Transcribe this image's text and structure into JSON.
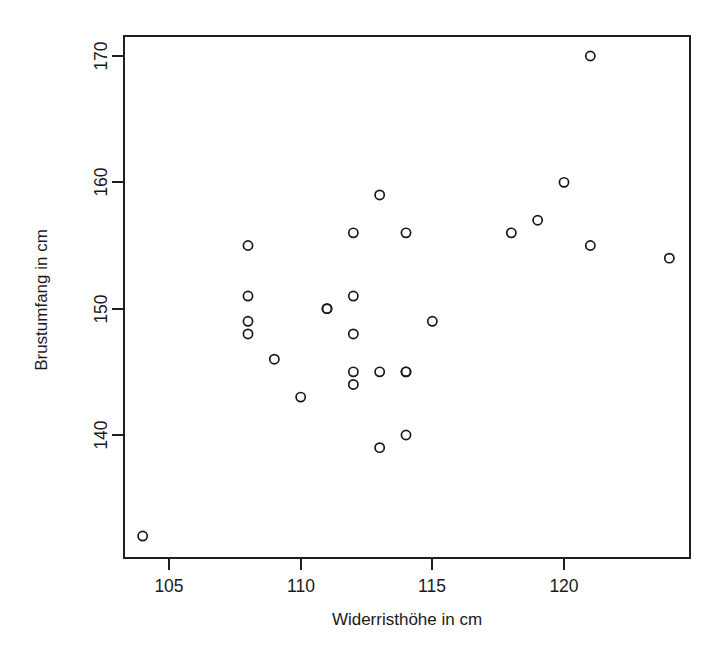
{
  "chart_data": {
    "type": "scatter",
    "title": "",
    "xlabel": "Widerristhöhe in cm",
    "ylabel": "Brustumfang in cm",
    "xlim": [
      103.2,
      125.6
    ],
    "ylim": [
      130.5,
      171.3
    ],
    "xticks": [
      105,
      110,
      115,
      120
    ],
    "xticklabels": [
      "105",
      "110",
      "115",
      "120"
    ],
    "yticks": [
      140,
      150,
      160,
      170
    ],
    "yticklabels": [
      "140",
      "150",
      "160",
      "170"
    ],
    "grid": false,
    "legend": null,
    "marker": "open-circle",
    "marker_color": "#181818",
    "n_points": 29,
    "x": [
      104,
      108,
      108,
      108,
      108,
      109,
      110,
      111,
      111,
      112,
      112,
      112,
      112,
      112,
      113,
      113,
      113,
      114,
      114,
      114,
      114,
      115,
      118,
      119,
      120,
      121,
      121,
      124
    ],
    "y": [
      132,
      155,
      151,
      149,
      148,
      146,
      143,
      150,
      150,
      156,
      151,
      148,
      145,
      144,
      159,
      145,
      139,
      156,
      145,
      145,
      140,
      149,
      156,
      157,
      160,
      170,
      155,
      154
    ],
    "points": [
      {
        "x": 104,
        "y": 132
      },
      {
        "x": 108,
        "y": 155
      },
      {
        "x": 108,
        "y": 151
      },
      {
        "x": 108,
        "y": 149
      },
      {
        "x": 108,
        "y": 148
      },
      {
        "x": 109,
        "y": 146
      },
      {
        "x": 110,
        "y": 143
      },
      {
        "x": 111,
        "y": 150
      },
      {
        "x": 111,
        "y": 150
      },
      {
        "x": 112,
        "y": 156
      },
      {
        "x": 112,
        "y": 151
      },
      {
        "x": 112,
        "y": 148
      },
      {
        "x": 112,
        "y": 145
      },
      {
        "x": 112,
        "y": 144
      },
      {
        "x": 113,
        "y": 159
      },
      {
        "x": 113,
        "y": 145
      },
      {
        "x": 113,
        "y": 139
      },
      {
        "x": 114,
        "y": 156
      },
      {
        "x": 114,
        "y": 145
      },
      {
        "x": 114,
        "y": 145
      },
      {
        "x": 114,
        "y": 140
      },
      {
        "x": 115,
        "y": 149
      },
      {
        "x": 118,
        "y": 156
      },
      {
        "x": 119,
        "y": 157
      },
      {
        "x": 120,
        "y": 160
      },
      {
        "x": 121,
        "y": 170
      },
      {
        "x": 121,
        "y": 155
      },
      {
        "x": 124,
        "y": 154
      }
    ]
  },
  "axis": {
    "x_title": "Widerristhöhe in cm",
    "y_title": "Brustumfang in cm",
    "x_tick_labels": [
      "105",
      "110",
      "115",
      "120"
    ],
    "y_tick_labels": [
      "140",
      "150",
      "160",
      "170"
    ]
  },
  "colors": {
    "background": "#ffffff",
    "axis": "#1f1f1f",
    "marker": "#181818",
    "text": "#1a1a1a"
  }
}
